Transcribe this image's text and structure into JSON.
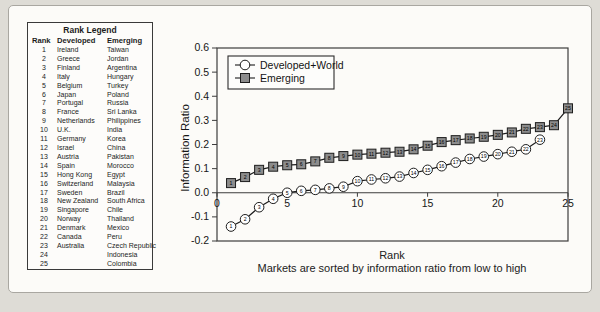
{
  "rank_legend": {
    "title": "Rank Legend",
    "columns": {
      "rank": "Rank",
      "developed": "Developed",
      "emerging": "Emerging"
    },
    "rows": [
      {
        "rank": "1",
        "developed": "Ireland",
        "emerging": "Taiwan"
      },
      {
        "rank": "2",
        "developed": "Greece",
        "emerging": "Jordan"
      },
      {
        "rank": "3",
        "developed": "Finland",
        "emerging": "Argentina"
      },
      {
        "rank": "4",
        "developed": "Italy",
        "emerging": "Hungary"
      },
      {
        "rank": "5",
        "developed": "Belgium",
        "emerging": "Turkey"
      },
      {
        "rank": "6",
        "developed": "Japan",
        "emerging": "Poland"
      },
      {
        "rank": "7",
        "developed": "Portugal",
        "emerging": "Russia"
      },
      {
        "rank": "8",
        "developed": "France",
        "emerging": "Sri Lanka"
      },
      {
        "rank": "9",
        "developed": "Netherlands",
        "emerging": "Philippines"
      },
      {
        "rank": "10",
        "developed": "U.K.",
        "emerging": "India"
      },
      {
        "rank": "11",
        "developed": "Germany",
        "emerging": "Korea"
      },
      {
        "rank": "12",
        "developed": "Israel",
        "emerging": "China"
      },
      {
        "rank": "13",
        "developed": "Austria",
        "emerging": "Pakistan"
      },
      {
        "rank": "14",
        "developed": "Spain",
        "emerging": "Morocco"
      },
      {
        "rank": "15",
        "developed": "Hong Kong",
        "emerging": "Egypt"
      },
      {
        "rank": "16",
        "developed": "Switzerland",
        "emerging": "Malaysia"
      },
      {
        "rank": "17",
        "developed": "Sweden",
        "emerging": "Brazil"
      },
      {
        "rank": "18",
        "developed": "New Zealand",
        "emerging": "South Africa"
      },
      {
        "rank": "19",
        "developed": "Singapore",
        "emerging": "Chile"
      },
      {
        "rank": "20",
        "developed": "Norway",
        "emerging": "Thailand"
      },
      {
        "rank": "21",
        "developed": "Denmark",
        "emerging": "Mexico"
      },
      {
        "rank": "22",
        "developed": "Canada",
        "emerging": "Peru"
      },
      {
        "rank": "23",
        "developed": "Australia",
        "emerging": "Czech Republic"
      },
      {
        "rank": "24",
        "developed": "",
        "emerging": "Indonesia"
      },
      {
        "rank": "25",
        "developed": "",
        "emerging": "Colombia"
      }
    ]
  },
  "chart_data": {
    "type": "line",
    "title": "",
    "xlabel": "Rank",
    "caption": "Markets are sorted by information ratio from low to high",
    "ylabel": "Information Ratio",
    "xlim": [
      0,
      25
    ],
    "ylim": [
      -0.2,
      0.6
    ],
    "x_tick_labels": [
      "0",
      "5",
      "10",
      "15",
      "20",
      "25"
    ],
    "y_tick_labels": [
      "0.6",
      "0.5",
      "0.4",
      "0.3",
      "0.2",
      "0.1",
      "0.0",
      "-0.1",
      "-0.2"
    ],
    "grid": false,
    "legend_position": "top-left",
    "point_labels": "rank",
    "series": [
      {
        "name": "Developed+World",
        "marker": "circle",
        "marker_fill": "#ffffff",
        "x": [
          1,
          2,
          3,
          4,
          5,
          6,
          7,
          8,
          9,
          10,
          11,
          12,
          13,
          14,
          15,
          16,
          17,
          18,
          19,
          20,
          21,
          22,
          23
        ],
        "values": [
          -0.14,
          -0.11,
          -0.06,
          -0.025,
          0.0,
          0.008,
          0.012,
          0.018,
          0.025,
          0.048,
          0.055,
          0.06,
          0.067,
          0.082,
          0.095,
          0.11,
          0.125,
          0.14,
          0.15,
          0.16,
          0.17,
          0.18,
          0.22
        ]
      },
      {
        "name": "Emerging",
        "marker": "square",
        "marker_fill": "#8c8c8c",
        "x": [
          1,
          2,
          3,
          4,
          5,
          6,
          7,
          8,
          9,
          10,
          11,
          12,
          13,
          14,
          15,
          16,
          17,
          18,
          19,
          20,
          21,
          22,
          23,
          24,
          25
        ],
        "values": [
          0.04,
          0.065,
          0.095,
          0.108,
          0.114,
          0.118,
          0.13,
          0.145,
          0.152,
          0.158,
          0.162,
          0.166,
          0.17,
          0.18,
          0.195,
          0.21,
          0.218,
          0.225,
          0.232,
          0.24,
          0.25,
          0.265,
          0.272,
          0.28,
          0.35
        ]
      }
    ],
    "colors": {
      "line": "#1d1d1d",
      "axis": "#3c3c3c",
      "square_fill": "#8c8c8c",
      "circle_fill": "#ffffff"
    }
  }
}
